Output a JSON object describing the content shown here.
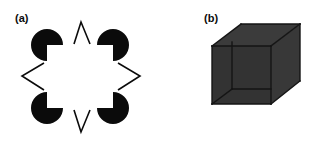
{
  "figure": {
    "width": 318,
    "height": 147,
    "background": "#ffffff",
    "ink": "#0b0b0b"
  },
  "panels": [
    {
      "id": "a",
      "label": "(a)",
      "name": "kanizsa-star-illusion",
      "description": "Illusory eight-pointed star formed by four pac-man inducers and four open chevron angle marks",
      "elements": {
        "pacmen": [
          {
            "name": "pacman-top-left",
            "cx": 47,
            "cy": 45,
            "r": 16,
            "wedge_from_deg": 0,
            "wedge_to_deg": 90,
            "fill": "#0b0b0b"
          },
          {
            "name": "pacman-top-right",
            "cx": 113,
            "cy": 45,
            "r": 16,
            "wedge_from_deg": 90,
            "wedge_to_deg": 180,
            "fill": "#0b0b0b"
          },
          {
            "name": "pacman-bottom-left",
            "cx": 47,
            "cy": 108,
            "r": 16,
            "wedge_from_deg": 270,
            "wedge_to_deg": 360,
            "fill": "#0b0b0b"
          },
          {
            "name": "pacman-bottom-right",
            "cx": 113,
            "cy": 108,
            "r": 16,
            "wedge_from_deg": 180,
            "wedge_to_deg": 270,
            "fill": "#0b0b0b"
          }
        ],
        "chevrons": [
          {
            "name": "chevron-top",
            "points": "74,44 81,22 90,44",
            "direction": "up"
          },
          {
            "name": "chevron-bottom",
            "points": "74,110 81,132 90,110",
            "direction": "down"
          },
          {
            "name": "chevron-left",
            "points": "44,63 22,76 44,90",
            "direction": "left"
          },
          {
            "name": "chevron-right",
            "points": "118,63 140,76 118,90",
            "direction": "right"
          }
        ],
        "stroke_width": 1.6,
        "stroke_color": "#0b0b0b"
      }
    },
    {
      "id": "b",
      "label": "(b)",
      "name": "necker-style-shaded-cube",
      "description": "Opaque dark gray cube drawn in parallel projection with visible interior edges",
      "elements": {
        "faces": [
          {
            "name": "cube-top-face",
            "points": "53,46 82,24 141,24 112,46",
            "fill": "#3b3b3b"
          },
          {
            "name": "cube-right-face",
            "points": "112,46 141,24 141,81 112,104",
            "fill": "#383838"
          },
          {
            "name": "cube-front-face",
            "points": "53,46 112,46 112,104 53,104",
            "fill": "#333333"
          }
        ],
        "edges": [
          {
            "name": "cube-edge-top-front",
            "x1": 53,
            "y1": 46,
            "x2": 112,
            "y2": 46
          },
          {
            "name": "cube-edge-top-back-left",
            "x1": 53,
            "y1": 46,
            "x2": 82,
            "y2": 24
          },
          {
            "name": "cube-edge-top-back",
            "x1": 82,
            "y1": 24,
            "x2": 141,
            "y2": 24
          },
          {
            "name": "cube-edge-top-right",
            "x1": 141,
            "y1": 24,
            "x2": 112,
            "y2": 46
          },
          {
            "name": "cube-edge-left-vertical",
            "x1": 53,
            "y1": 46,
            "x2": 53,
            "y2": 104
          },
          {
            "name": "cube-edge-mid-vertical",
            "x1": 112,
            "y1": 46,
            "x2": 112,
            "y2": 104
          },
          {
            "name": "cube-edge-right-vertical",
            "x1": 141,
            "y1": 24,
            "x2": 141,
            "y2": 81
          },
          {
            "name": "cube-edge-bottom-front",
            "x1": 53,
            "y1": 104,
            "x2": 112,
            "y2": 104
          },
          {
            "name": "cube-edge-bottom-right",
            "x1": 112,
            "y1": 104,
            "x2": 141,
            "y2": 81
          },
          {
            "name": "cube-edge-interior-horizontal",
            "x1": 73,
            "y1": 89,
            "x2": 112,
            "y2": 89
          },
          {
            "name": "cube-edge-interior-vertical",
            "x1": 73,
            "y1": 42,
            "x2": 73,
            "y2": 89
          },
          {
            "name": "cube-edge-interior-diagonal",
            "x1": 53,
            "y1": 104,
            "x2": 73,
            "y2": 89
          }
        ],
        "stroke_width": 1.4,
        "stroke_color": "#151515"
      }
    }
  ]
}
